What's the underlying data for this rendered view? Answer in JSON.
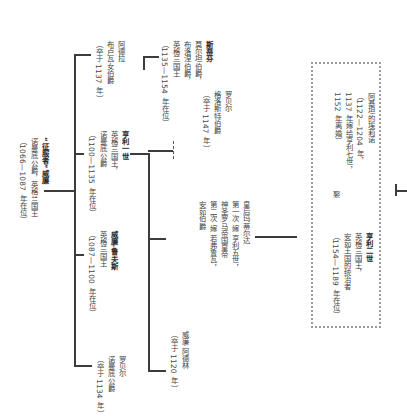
{
  "diagram": {
    "type": "family-tree",
    "orientation": "rotated-90-clockwise",
    "root": {
      "name": "“征服者”威廉",
      "title": "诺曼底公爵，英格兰国王",
      "reign": "（1066—1087 年在位）"
    },
    "children": [
      {
        "name": "阿德拉",
        "title": "布卢瓦女伯爵",
        "note": "（卒于 1137 年）",
        "children": [
          {
            "name": "斯蒂芬",
            "title_lines": [
              "莫尔坦伯爵，",
              "布洛涅伯爵，",
              "英格兰国王"
            ],
            "reign": "（1135—1154 年在位）"
          }
        ]
      },
      {
        "name": "亨利一世",
        "title_lines": [
          "英格兰国王，",
          "诺曼底公爵"
        ],
        "reign": "（1100—1135 年在位）",
        "children": [
          {
            "name": "罗贝尔",
            "title": "格洛斯特伯爵",
            "note": "（卒于 1147 年）",
            "link": "illegitimate-dashed"
          },
          {
            "name": "皇后玛蒂尔达",
            "marriages": [
              "第一次  嫁  亨利五世，",
              "神圣罗马帝国皇帝",
              "第二次  嫁  若弗鲁瓦，",
              "安茹伯爵"
            ],
            "children": [
              {
                "name": "亨利二世",
                "title_lines": [
                  "英格兰国王，",
                  "安茹王国的统治者"
                ],
                "reign": "（1154—1189 年在位）",
                "spouse_label": "娶",
                "spouse": {
                  "name": "阿基坦的埃莉诺",
                  "lines": [
                    "（1122—1204 年，",
                    "1137 年嫁给亨利七世，",
                    "1152 年离婚）"
                  ]
                }
              }
            ]
          },
          {
            "name": "威廉·阿德林",
            "note": "（卒于 1120 年）"
          }
        ]
      },
      {
        "name": "威廉·鲁夫斯",
        "title": "英格兰国王",
        "reign": "（1087—1100 年在位）"
      },
      {
        "name": "罗贝尔",
        "title": "诺曼底公爵",
        "note": "（卒于 1134 年）"
      }
    ]
  }
}
